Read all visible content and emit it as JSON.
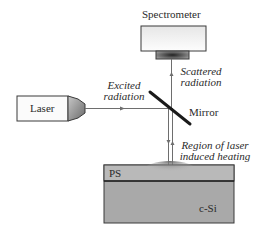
{
  "diagram": {
    "spectrometer": {
      "label": "Spectrometer"
    },
    "laser": {
      "label": "Laser"
    },
    "mirror": {
      "label": "Mirror"
    },
    "beams": {
      "excited": {
        "line1": "Excited",
        "line2": "radiation"
      },
      "scattered": {
        "line1": "Scattered",
        "line2": "radiation"
      }
    },
    "heating_region": {
      "line1": "Region of laser",
      "line2": "induced heating"
    },
    "sample": {
      "top_layer": "PS",
      "substrate": "c-Si"
    },
    "colors": {
      "line": "#6e6e6e",
      "box_stroke": "#3a3a3a",
      "substrate_fill": "#a9a9a9",
      "ps_fill": "#b9b9b9",
      "heat_spot": "#6a6a6a",
      "mirror": "#1a1a1a"
    }
  }
}
